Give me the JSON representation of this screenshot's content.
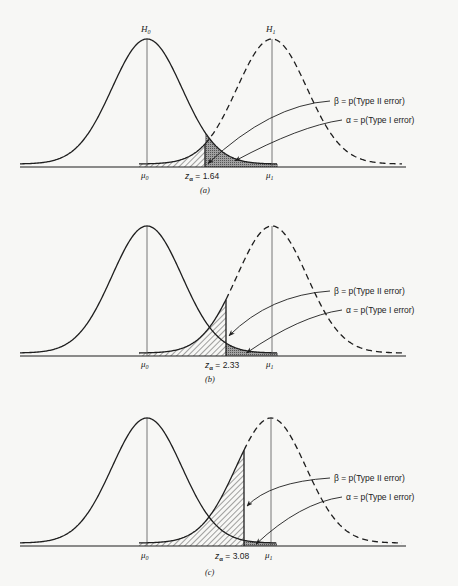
{
  "figure": {
    "panels": [
      {
        "id": "a",
        "caption": "(a)",
        "baseline_y": 167,
        "peak_y": 39,
        "mu0_x": 147,
        "mu1_x": 272,
        "crit_x": 205,
        "h0_label": "H",
        "h0_sub": "0",
        "h1_label": "H",
        "h1_sub": "1",
        "mu0_label": "μ",
        "mu0_sub": "0",
        "mu1_label": "μ",
        "mu1_sub": "1",
        "z_label": "z",
        "z_sub": "α",
        "z_value": " = 1.64",
        "beta_label": "β = p(Type II error)",
        "alpha_label": "α = p(Type I error)",
        "beta_label_y": 104,
        "alpha_label_y": 123
      },
      {
        "id": "b",
        "caption": "(b)",
        "baseline_y": 356,
        "peak_y": 226,
        "mu0_x": 147,
        "mu1_x": 272,
        "crit_x": 226,
        "mu0_label": "μ",
        "mu0_sub": "0",
        "mu1_label": "μ",
        "mu1_sub": "1",
        "z_label": "z",
        "z_sub": "α",
        "z_value": " = 2.33",
        "beta_label": "β = p(Type II error)",
        "alpha_label": "α = p(Type I error)",
        "beta_label_y": 294,
        "alpha_label_y": 313
      },
      {
        "id": "c",
        "caption": "(c)",
        "baseline_y": 546,
        "peak_y": 418,
        "mu0_x": 147,
        "mu1_x": 271,
        "crit_x": 244,
        "mu0_label": "μ",
        "mu0_sub": "0",
        "mu1_label": "μ",
        "mu1_sub": "1",
        "z_label": "z",
        "z_sub": "α",
        "z_value": " = 3.08",
        "beta_label": "β = p(Type II error)",
        "alpha_label": "α = p(Type I error)",
        "beta_label_y": 481,
        "alpha_label_y": 500
      }
    ],
    "colors": {
      "ink": "#1e1e1e",
      "alpha_fill": "#8a8a8a",
      "hatch": "#333333",
      "background": "#f7f7f5"
    }
  }
}
